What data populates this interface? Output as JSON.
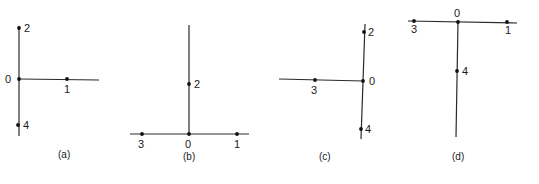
{
  "figure": {
    "panels": [
      {
        "id": "a",
        "caption": "(a)",
        "axes": [
          {
            "x1": 19,
            "y1": 26,
            "x2": 19,
            "y2": 136
          },
          {
            "x1": 19,
            "y1": 79,
            "x2": 99,
            "y2": 80
          }
        ],
        "points": [
          {
            "label": "2",
            "x": 19,
            "y": 28,
            "lx": 24,
            "ly": 32
          },
          {
            "label": "0",
            "x": 19,
            "y": 79,
            "lx": 5,
            "ly": 83
          },
          {
            "label": "1",
            "x": 67,
            "y": 79,
            "lx": 64,
            "ly": 93
          },
          {
            "label": "4",
            "x": 18,
            "y": 125,
            "lx": 23,
            "ly": 129
          }
        ],
        "caption_x": 58,
        "caption_y": 158
      },
      {
        "id": "b",
        "caption": "(b)",
        "axes": [
          {
            "x1": 189,
            "y1": 25,
            "x2": 189,
            "y2": 134
          },
          {
            "x1": 130,
            "y1": 134,
            "x2": 249,
            "y2": 134
          }
        ],
        "points": [
          {
            "label": "2",
            "x": 189,
            "y": 84,
            "lx": 194,
            "ly": 88
          },
          {
            "label": "3",
            "x": 142,
            "y": 134,
            "lx": 138,
            "ly": 148
          },
          {
            "label": "0",
            "x": 189,
            "y": 134,
            "lx": 185,
            "ly": 148
          },
          {
            "label": "1",
            "x": 237,
            "y": 134,
            "lx": 234,
            "ly": 148
          }
        ],
        "caption_x": 183,
        "caption_y": 160
      },
      {
        "id": "c",
        "caption": "(c)",
        "axes": [
          {
            "x1": 365,
            "y1": 24,
            "x2": 361,
            "y2": 139
          },
          {
            "x1": 279,
            "y1": 79,
            "x2": 363,
            "y2": 81
          }
        ],
        "points": [
          {
            "label": "2",
            "x": 364,
            "y": 32,
            "lx": 368,
            "ly": 36
          },
          {
            "label": "3",
            "x": 315,
            "y": 80,
            "lx": 311,
            "ly": 94
          },
          {
            "label": "0",
            "x": 363,
            "y": 81,
            "lx": 369,
            "ly": 85
          },
          {
            "label": "4",
            "x": 361,
            "y": 129,
            "lx": 365,
            "ly": 133
          }
        ],
        "caption_x": 319,
        "caption_y": 160
      },
      {
        "id": "d",
        "caption": "(d)",
        "axes": [
          {
            "x1": 408,
            "y1": 21,
            "x2": 517,
            "y2": 23
          },
          {
            "x1": 458,
            "y1": 22,
            "x2": 456,
            "y2": 137
          }
        ],
        "points": [
          {
            "label": "3",
            "x": 414,
            "y": 21,
            "lx": 411,
            "ly": 33
          },
          {
            "label": "0",
            "x": 458,
            "y": 22,
            "lx": 454,
            "ly": 17
          },
          {
            "label": "1",
            "x": 507,
            "y": 22,
            "lx": 505,
            "ly": 34
          },
          {
            "label": "4",
            "x": 457,
            "y": 71,
            "lx": 462,
            "ly": 75
          }
        ],
        "caption_x": 452,
        "caption_y": 160
      }
    ],
    "colors": {
      "line": "#2a2a2a",
      "point": "#111111",
      "text": "#1a1a1a",
      "background": "#ffffff"
    }
  }
}
